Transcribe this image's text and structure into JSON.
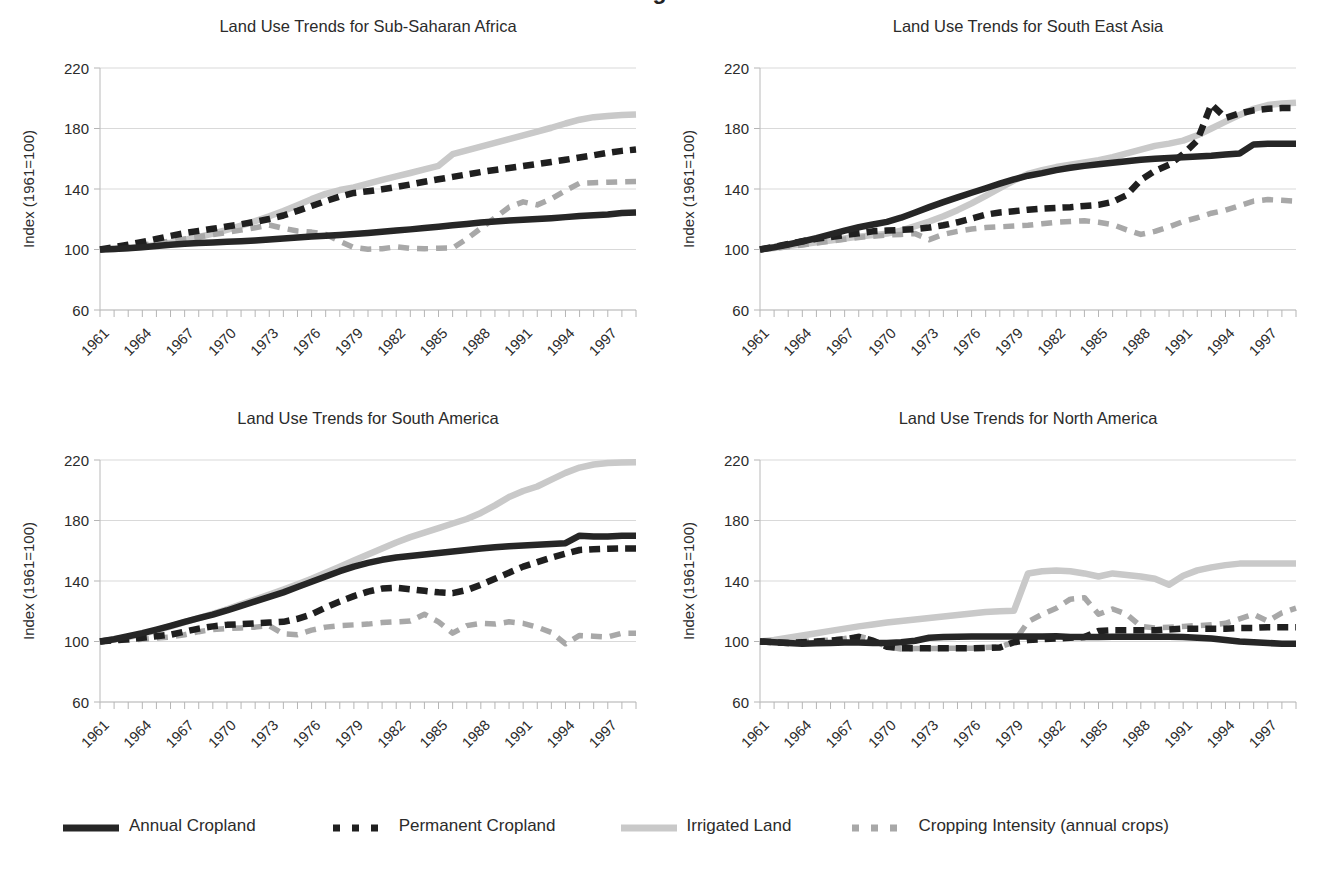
{
  "figure": {
    "cut_off_title_fragment": "g",
    "background": "#ffffff"
  },
  "series_styles": {
    "annual_cropland": {
      "color": "#262626",
      "dash": "none",
      "width": 6.5
    },
    "permanent_cropland": {
      "color": "#1f1f1f",
      "dash": "11,7",
      "width": 6.5
    },
    "irrigated_land": {
      "color": "#c9c9c9",
      "dash": "none",
      "width": 6.5
    },
    "cropping_intensity": {
      "color": "#a8a8a8",
      "dash": "11,8",
      "width": 5.5
    }
  },
  "legend": {
    "items": [
      {
        "label": "Annual Cropland",
        "key": "annual_cropland"
      },
      {
        "label": "Permanent  Cropland",
        "key": "permanent_cropland"
      },
      {
        "label": "Irrigated Land",
        "key": "irrigated_land"
      },
      {
        "label": "Cropping Intensity (annual crops)",
        "key": "cropping_intensity"
      }
    ]
  },
  "axis": {
    "ylabel": "Index (1961=100)",
    "yticks": [
      220,
      180,
      140,
      100,
      60
    ],
    "ylim": [
      60,
      220
    ],
    "xlim": [
      1961,
      1999
    ],
    "xticks": [
      1961,
      1964,
      1967,
      1970,
      1973,
      1976,
      1979,
      1982,
      1985,
      1988,
      1991,
      1994,
      1997
    ],
    "xminor_step": 1,
    "xtick_rotation_deg": -45
  },
  "chart_data": [
    {
      "type": "line",
      "title": "Land Use Trends for Sub-Saharan Africa",
      "xlabel": "",
      "ylabel": "Index (1961=100)",
      "ylim": [
        60,
        220
      ],
      "xlim": [
        1961,
        1999
      ],
      "grid": true,
      "legend_position": "bottom-figure",
      "x": [
        1961,
        1962,
        1963,
        1964,
        1965,
        1966,
        1967,
        1968,
        1969,
        1970,
        1971,
        1972,
        1973,
        1974,
        1975,
        1976,
        1977,
        1978,
        1979,
        1980,
        1981,
        1982,
        1983,
        1984,
        1985,
        1986,
        1987,
        1988,
        1989,
        1990,
        1991,
        1992,
        1993,
        1994,
        1995,
        1996,
        1997,
        1998,
        1999
      ],
      "series": [
        {
          "name": "Annual Cropland",
          "values": [
            100,
            100.3,
            100.8,
            101.5,
            102.3,
            103.1,
            103.8,
            104.3,
            104.7,
            105.1,
            105.5,
            106.0,
            106.6,
            107.3,
            108.0,
            108.6,
            109.1,
            109.6,
            110.2,
            110.9,
            111.7,
            112.5,
            113.3,
            114.2,
            115.1,
            116.0,
            116.9,
            117.8,
            118.5,
            119.1,
            119.6,
            120.1,
            120.7,
            121.4,
            122.1,
            122.7,
            123.2,
            124.2,
            124.4
          ]
        },
        {
          "name": "Permanent  Cropland",
          "values": [
            100,
            101.5,
            103.2,
            105.0,
            107.0,
            109.0,
            110.8,
            112.3,
            113.7,
            115.2,
            116.7,
            118.3,
            120.2,
            122.5,
            125.5,
            128.8,
            132.0,
            135.0,
            137.4,
            138.5,
            139.8,
            141.3,
            143.0,
            144.8,
            146.4,
            148.0,
            149.6,
            151.2,
            152.6,
            153.9,
            155.2,
            156.5,
            157.9,
            159.3,
            160.8,
            162.3,
            163.9,
            165.2,
            166.1
          ]
        },
        {
          "name": "Irrigated Land",
          "values": [
            100,
            100.4,
            101.0,
            101.8,
            103.0,
            104.5,
            106.3,
            108.3,
            110.5,
            113.0,
            115.8,
            118.8,
            122.0,
            125.5,
            129.3,
            133.3,
            136.8,
            139.3,
            141.0,
            143.5,
            146.0,
            148.3,
            150.6,
            153.0,
            155.3,
            163.0,
            165.5,
            168.0,
            170.5,
            173.0,
            175.5,
            178.0,
            180.5,
            183.3,
            185.8,
            187.5,
            188.3,
            189.0,
            189.3
          ]
        },
        {
          "name": "Cropping Intensity (annual crops)",
          "values": [
            100,
            100.8,
            101.5,
            102.8,
            104.2,
            105.6,
            107.0,
            108.4,
            109.8,
            111.3,
            112.8,
            114.4,
            116.2,
            114.0,
            112.2,
            111.5,
            110.0,
            105.5,
            101.3,
            100.2,
            100.5,
            101.8,
            100.8,
            100.5,
            100.8,
            101.0,
            107.0,
            114.0,
            121.0,
            128.0,
            131.5,
            129.5,
            133.5,
            139.0,
            143.8,
            144.2,
            144.5,
            144.8,
            145.0
          ]
        }
      ]
    },
    {
      "type": "line",
      "title": "Land Use Trends for South East Asia",
      "xlabel": "",
      "ylabel": "Index (1961=100)",
      "ylim": [
        60,
        220
      ],
      "xlim": [
        1961,
        1999
      ],
      "grid": true,
      "legend_position": "bottom-figure",
      "x": [
        1961,
        1962,
        1963,
        1964,
        1965,
        1966,
        1967,
        1968,
        1969,
        1970,
        1971,
        1972,
        1973,
        1974,
        1975,
        1976,
        1977,
        1978,
        1979,
        1980,
        1981,
        1982,
        1983,
        1984,
        1985,
        1986,
        1987,
        1988,
        1989,
        1990,
        1991,
        1992,
        1993,
        1994,
        1995,
        1996,
        1997,
        1998,
        1999
      ],
      "series": [
        {
          "name": "Annual Cropland",
          "values": [
            100,
            101.5,
            103.3,
            105.3,
            107.5,
            110.0,
            112.5,
            114.7,
            116.5,
            118.3,
            121.0,
            124.5,
            128.0,
            131.3,
            134.5,
            137.5,
            140.5,
            143.5,
            146.3,
            148.8,
            150.5,
            152.5,
            154.0,
            155.3,
            156.3,
            157.3,
            158.3,
            159.3,
            160.0,
            160.5,
            161.0,
            161.5,
            162.0,
            162.8,
            163.5,
            169.5,
            170.0,
            170.0,
            170.0
          ]
        },
        {
          "name": "Permanent  Cropland",
          "values": [
            100,
            101.8,
            103.6,
            105.5,
            107.0,
            108.3,
            109.5,
            110.7,
            112.0,
            112.5,
            113.0,
            113.5,
            114.5,
            116.0,
            118.0,
            120.5,
            123.0,
            124.5,
            125.3,
            126.3,
            127.0,
            127.5,
            128.0,
            128.8,
            129.5,
            131.5,
            136.0,
            146.0,
            152.0,
            156.0,
            163.0,
            172.0,
            196.0,
            187.0,
            190.0,
            192.0,
            193.0,
            193.5,
            193.5
          ]
        },
        {
          "name": "Irrigated Land",
          "values": [
            100,
            101.0,
            102.3,
            103.5,
            104.8,
            106.0,
            107.3,
            108.5,
            109.5,
            110.5,
            112.5,
            115.5,
            118.5,
            122.0,
            126.0,
            130.5,
            135.5,
            140.5,
            145.5,
            150.0,
            152.5,
            154.5,
            156.0,
            157.5,
            159.0,
            161.0,
            163.5,
            166.0,
            168.5,
            170.0,
            172.0,
            175.5,
            180.0,
            184.5,
            189.0,
            193.0,
            195.5,
            196.5,
            197.0
          ]
        },
        {
          "name": "Cropping Intensity (annual crops)",
          "values": [
            100,
            100.8,
            101.8,
            103.0,
            104.3,
            105.5,
            106.8,
            108.0,
            108.8,
            109.5,
            110.0,
            110.5,
            106.5,
            110.0,
            112.0,
            113.5,
            114.5,
            115.0,
            115.5,
            116.0,
            117.0,
            118.0,
            118.5,
            119.0,
            118.0,
            116.5,
            113.0,
            110.0,
            112.0,
            115.0,
            118.5,
            121.0,
            124.0,
            126.0,
            129.0,
            132.0,
            133.0,
            132.5,
            132.0
          ]
        }
      ]
    },
    {
      "type": "line",
      "title": "Land Use Trends for South America",
      "xlabel": "",
      "ylabel": "Index (1961=100)",
      "ylim": [
        60,
        220
      ],
      "xlim": [
        1961,
        1999
      ],
      "grid": true,
      "legend_position": "bottom-figure",
      "x": [
        1961,
        1962,
        1963,
        1964,
        1965,
        1966,
        1967,
        1968,
        1969,
        1970,
        1971,
        1972,
        1973,
        1974,
        1975,
        1976,
        1977,
        1978,
        1979,
        1980,
        1981,
        1982,
        1983,
        1984,
        1985,
        1986,
        1987,
        1988,
        1989,
        1990,
        1991,
        1992,
        1993,
        1994,
        1995,
        1996,
        1997,
        1998,
        1999
      ],
      "series": [
        {
          "name": "Annual Cropland",
          "values": [
            100,
            101.5,
            103.5,
            105.5,
            107.8,
            110.3,
            113.0,
            115.5,
            117.8,
            120.5,
            123.5,
            126.5,
            129.5,
            132.5,
            136.0,
            139.5,
            143.0,
            146.5,
            149.5,
            152.0,
            154.0,
            155.5,
            156.5,
            157.5,
            158.5,
            159.5,
            160.5,
            161.5,
            162.3,
            163.0,
            163.5,
            164.0,
            164.5,
            165.0,
            170.0,
            169.5,
            169.5,
            170.0,
            170.0
          ]
        },
        {
          "name": "Permanent  Cropland",
          "values": [
            100,
            100.8,
            101.5,
            102.5,
            103.5,
            104.5,
            106.5,
            108.5,
            110.0,
            111.0,
            111.5,
            112.0,
            112.5,
            113.0,
            115.0,
            118.0,
            122.5,
            126.5,
            130.0,
            133.0,
            135.0,
            135.5,
            134.5,
            133.5,
            132.5,
            132.0,
            134.0,
            137.5,
            141.5,
            145.5,
            149.5,
            152.5,
            155.5,
            158.0,
            160.5,
            161.0,
            161.3,
            161.5,
            161.5
          ]
        },
        {
          "name": "Irrigated Land",
          "values": [
            100,
            101.3,
            103.0,
            105.0,
            107.3,
            110.0,
            112.8,
            115.5,
            118.3,
            121.3,
            124.5,
            127.8,
            131.0,
            134.3,
            137.8,
            141.5,
            145.5,
            149.5,
            153.5,
            157.5,
            161.5,
            165.5,
            169.0,
            172.0,
            175.0,
            178.0,
            181.0,
            185.0,
            190.0,
            195.5,
            199.5,
            202.5,
            207.0,
            211.5,
            215.0,
            217.0,
            218.0,
            218.3,
            218.5
          ]
        },
        {
          "name": "Cropping Intensity (annual crops)",
          "values": [
            100,
            100.5,
            101.0,
            101.5,
            102.3,
            103.0,
            104.5,
            106.5,
            108.0,
            108.5,
            109.0,
            109.5,
            110.5,
            105.0,
            104.5,
            107.5,
            109.5,
            110.5,
            111.0,
            111.5,
            112.5,
            113.0,
            113.5,
            118.0,
            113.0,
            105.5,
            110.5,
            112.0,
            111.5,
            113.0,
            112.0,
            109.5,
            106.0,
            98.5,
            104.0,
            103.5,
            103.0,
            105.5,
            105.5
          ]
        }
      ]
    },
    {
      "type": "line",
      "title": "Land Use Trends for North America",
      "xlabel": "",
      "ylabel": "Index (1961=100)",
      "ylim": [
        60,
        220
      ],
      "xlim": [
        1961,
        1999
      ],
      "grid": true,
      "legend_position": "bottom-figure",
      "x": [
        1961,
        1962,
        1963,
        1964,
        1965,
        1966,
        1967,
        1968,
        1969,
        1970,
        1971,
        1972,
        1973,
        1974,
        1975,
        1976,
        1977,
        1978,
        1979,
        1980,
        1981,
        1982,
        1983,
        1984,
        1985,
        1986,
        1987,
        1988,
        1989,
        1990,
        1991,
        1992,
        1993,
        1994,
        1995,
        1996,
        1997,
        1998,
        1999
      ],
      "series": [
        {
          "name": "Annual Cropland",
          "values": [
            100,
            99.5,
            99.0,
            98.5,
            98.8,
            99.0,
            99.3,
            99.3,
            99.0,
            99.0,
            99.5,
            100.5,
            102.5,
            103.0,
            103.2,
            103.3,
            103.3,
            103.3,
            103.3,
            103.3,
            103.3,
            103.5,
            103.0,
            103.0,
            103.0,
            103.2,
            103.2,
            103.2,
            103.2,
            103.2,
            103.0,
            102.5,
            102.0,
            101.0,
            100.0,
            99.5,
            99.0,
            98.5,
            98.5
          ]
        },
        {
          "name": "Permanent  Cropland",
          "values": [
            100,
            99.5,
            99.0,
            99.5,
            100.0,
            100.5,
            101.5,
            103.0,
            100.5,
            96.5,
            95.5,
            95.5,
            95.5,
            95.5,
            95.5,
            95.5,
            95.8,
            96.0,
            99.5,
            101.0,
            101.5,
            102.0,
            102.5,
            103.0,
            107.0,
            107.5,
            107.5,
            107.5,
            107.5,
            108.0,
            108.5,
            108.5,
            108.5,
            108.5,
            109.0,
            109.0,
            109.5,
            109.5,
            109.5
          ]
        },
        {
          "name": "Irrigated Land",
          "values": [
            100,
            101.0,
            102.5,
            104.0,
            105.5,
            107.0,
            108.5,
            110.0,
            111.3,
            112.5,
            113.5,
            114.5,
            115.5,
            116.5,
            117.5,
            118.5,
            119.5,
            120.0,
            120.3,
            145.0,
            146.5,
            147.0,
            146.5,
            145.0,
            143.0,
            145.0,
            144.0,
            143.0,
            141.5,
            137.5,
            143.5,
            147.0,
            149.0,
            150.5,
            151.5,
            151.5,
            151.5,
            151.5,
            151.5
          ]
        },
        {
          "name": "Cropping Intensity (annual crops)",
          "values": [
            100,
            99.8,
            99.5,
            100.0,
            100.5,
            101.0,
            102.0,
            103.5,
            101.0,
            96.5,
            95.0,
            95.3,
            95.3,
            95.5,
            95.5,
            95.5,
            96.0,
            96.5,
            99.5,
            113.0,
            118.0,
            122.0,
            128.0,
            129.0,
            118.0,
            121.5,
            118.0,
            110.0,
            109.0,
            109.5,
            110.0,
            110.5,
            111.0,
            112.0,
            115.0,
            118.0,
            113.5,
            119.0,
            122.0
          ]
        }
      ]
    }
  ]
}
